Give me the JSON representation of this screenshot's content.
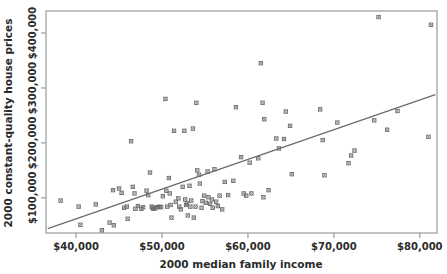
{
  "chart_data": {
    "type": "scatter",
    "title": "",
    "xlabel": "2000 median family income",
    "ylabel": "2000 constant-quality house prices",
    "xlim": [
      36500,
      82000
    ],
    "ylim": [
      36000,
      440000
    ],
    "grid": false,
    "legend": null,
    "xticks": [
      40000,
      50000,
      60000,
      70000,
      80000
    ],
    "xticklabels": [
      "$40,000",
      "$50,000",
      "$60,000",
      "$70,000",
      "$80,000"
    ],
    "yticks": [
      100000,
      200000,
      300000,
      400000
    ],
    "yticklabels": [
      "$100,000",
      "$200,000",
      "$300,000",
      "$400,000"
    ],
    "marker": "x-square",
    "marker_color": "#6b6b6b",
    "line_color": "#6b6b6b",
    "frame_color": "#9a9a9a",
    "trendline": {
      "type": "linear-fit",
      "x_start": 36700,
      "y_start": 44000,
      "x_end": 81800,
      "y_end": 288000
    },
    "points": [
      {
        "x": 38200,
        "y": 95000
      },
      {
        "x": 40300,
        "y": 84000
      },
      {
        "x": 40500,
        "y": 51000
      },
      {
        "x": 42300,
        "y": 88000
      },
      {
        "x": 43000,
        "y": 41000
      },
      {
        "x": 43900,
        "y": 55000
      },
      {
        "x": 44300,
        "y": 114000
      },
      {
        "x": 44400,
        "y": 50000
      },
      {
        "x": 45000,
        "y": 117000
      },
      {
        "x": 45300,
        "y": 109000
      },
      {
        "x": 45600,
        "y": 82000
      },
      {
        "x": 45900,
        "y": 84000
      },
      {
        "x": 46000,
        "y": 62000
      },
      {
        "x": 46400,
        "y": 203000
      },
      {
        "x": 46600,
        "y": 120000
      },
      {
        "x": 46800,
        "y": 108000
      },
      {
        "x": 46900,
        "y": 80000
      },
      {
        "x": 47200,
        "y": 85000
      },
      {
        "x": 47600,
        "y": 80000
      },
      {
        "x": 47800,
        "y": 83000
      },
      {
        "x": 48200,
        "y": 113000
      },
      {
        "x": 48400,
        "y": 105000
      },
      {
        "x": 48600,
        "y": 146000
      },
      {
        "x": 48800,
        "y": 84000
      },
      {
        "x": 48900,
        "y": 82000
      },
      {
        "x": 49000,
        "y": 80000
      },
      {
        "x": 49200,
        "y": 81000
      },
      {
        "x": 49400,
        "y": 83000
      },
      {
        "x": 49700,
        "y": 84000
      },
      {
        "x": 49900,
        "y": 83000
      },
      {
        "x": 50100,
        "y": 103000
      },
      {
        "x": 50400,
        "y": 280000
      },
      {
        "x": 50500,
        "y": 113000
      },
      {
        "x": 50600,
        "y": 84000
      },
      {
        "x": 50800,
        "y": 136000
      },
      {
        "x": 50900,
        "y": 108000
      },
      {
        "x": 51000,
        "y": 87000
      },
      {
        "x": 51100,
        "y": 64000
      },
      {
        "x": 51400,
        "y": 222000
      },
      {
        "x": 51600,
        "y": 93000
      },
      {
        "x": 51900,
        "y": 99000
      },
      {
        "x": 52000,
        "y": 84000
      },
      {
        "x": 52200,
        "y": 79000
      },
      {
        "x": 52400,
        "y": 120000
      },
      {
        "x": 52600,
        "y": 222000
      },
      {
        "x": 52700,
        "y": 97000
      },
      {
        "x": 52800,
        "y": 87000
      },
      {
        "x": 52900,
        "y": 90000
      },
      {
        "x": 53000,
        "y": 68000
      },
      {
        "x": 53200,
        "y": 122000
      },
      {
        "x": 53300,
        "y": 84000
      },
      {
        "x": 53400,
        "y": 95000
      },
      {
        "x": 53600,
        "y": 226000
      },
      {
        "x": 53700,
        "y": 64000
      },
      {
        "x": 53900,
        "y": 84000
      },
      {
        "x": 54000,
        "y": 273000
      },
      {
        "x": 54100,
        "y": 150000
      },
      {
        "x": 54300,
        "y": 142000
      },
      {
        "x": 54400,
        "y": 126000
      },
      {
        "x": 54600,
        "y": 82000
      },
      {
        "x": 54700,
        "y": 94000
      },
      {
        "x": 54900,
        "y": 104000
      },
      {
        "x": 55100,
        "y": 91000
      },
      {
        "x": 55300,
        "y": 148000
      },
      {
        "x": 55400,
        "y": 101000
      },
      {
        "x": 55600,
        "y": 89000
      },
      {
        "x": 55800,
        "y": 97000
      },
      {
        "x": 55900,
        "y": 82000
      },
      {
        "x": 56100,
        "y": 152000
      },
      {
        "x": 56300,
        "y": 93000
      },
      {
        "x": 56500,
        "y": 85000
      },
      {
        "x": 56700,
        "y": 104000
      },
      {
        "x": 57000,
        "y": 79000
      },
      {
        "x": 57300,
        "y": 129000
      },
      {
        "x": 57700,
        "y": 105000
      },
      {
        "x": 58300,
        "y": 131000
      },
      {
        "x": 58600,
        "y": 265000
      },
      {
        "x": 59200,
        "y": 174000
      },
      {
        "x": 59500,
        "y": 108000
      },
      {
        "x": 59800,
        "y": 104000
      },
      {
        "x": 60200,
        "y": 164000
      },
      {
        "x": 60400,
        "y": 108000
      },
      {
        "x": 61200,
        "y": 172000
      },
      {
        "x": 61500,
        "y": 345000
      },
      {
        "x": 61700,
        "y": 273000
      },
      {
        "x": 61800,
        "y": 101000
      },
      {
        "x": 61900,
        "y": 243000
      },
      {
        "x": 62400,
        "y": 114000
      },
      {
        "x": 63300,
        "y": 208000
      },
      {
        "x": 63600,
        "y": 190000
      },
      {
        "x": 64200,
        "y": 207000
      },
      {
        "x": 64400,
        "y": 257000
      },
      {
        "x": 64900,
        "y": 231000
      },
      {
        "x": 65100,
        "y": 143000
      },
      {
        "x": 68400,
        "y": 261000
      },
      {
        "x": 68700,
        "y": 205000
      },
      {
        "x": 68900,
        "y": 141000
      },
      {
        "x": 70400,
        "y": 237000
      },
      {
        "x": 71700,
        "y": 163000
      },
      {
        "x": 72000,
        "y": 177000
      },
      {
        "x": 72400,
        "y": 186000
      },
      {
        "x": 74700,
        "y": 241000
      },
      {
        "x": 75200,
        "y": 429000
      },
      {
        "x": 76200,
        "y": 224000
      },
      {
        "x": 77400,
        "y": 258000
      },
      {
        "x": 81000,
        "y": 211000
      },
      {
        "x": 81300,
        "y": 415000
      }
    ]
  }
}
